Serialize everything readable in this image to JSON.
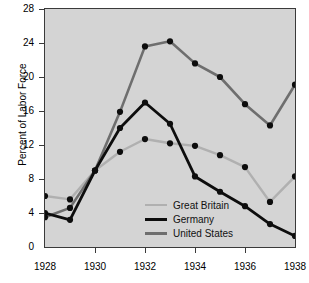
{
  "chart_data": {
    "type": "line",
    "title": "",
    "xlabel": "",
    "ylabel": "Percent of Labor Force",
    "x": [
      1928,
      1929,
      1930,
      1931,
      1932,
      1933,
      1934,
      1935,
      1936,
      1937,
      1938
    ],
    "xlim": [
      1928,
      1938
    ],
    "ylim": [
      0,
      28
    ],
    "yticks": [
      0,
      4,
      8,
      12,
      16,
      20,
      24,
      28
    ],
    "xticks": [
      1928,
      1930,
      1932,
      1934,
      1936,
      1938
    ],
    "xtick_labels": [
      "1928",
      "1930",
      "1932",
      "1934",
      "1936",
      "1938"
    ],
    "ytick_labels": [
      "0",
      "4",
      "8",
      "12",
      "16",
      "20",
      "24",
      "28"
    ],
    "grid": false,
    "legend_position": "center-left",
    "series": [
      {
        "name": "Great Britain",
        "color": "#b0b0b0",
        "width": 2.4,
        "values": [
          6.0,
          5.6,
          9.0,
          11.2,
          12.7,
          12.2,
          11.9,
          10.8,
          9.4,
          5.3,
          8.3
        ]
      },
      {
        "name": "Germany",
        "color": "#0d0d0d",
        "width": 2.8,
        "values": [
          4.0,
          3.2,
          9.0,
          14.0,
          17.0,
          14.5,
          8.3,
          6.5,
          4.8,
          2.7,
          1.3
        ]
      },
      {
        "name": "United States",
        "color": "#6e6e6e",
        "width": 2.6,
        "values": [
          3.5,
          4.6,
          9.0,
          15.9,
          23.6,
          24.2,
          21.6,
          20.0,
          16.8,
          14.3,
          19.1
        ]
      }
    ]
  },
  "legend": {
    "items": [
      {
        "label": "Great Britain"
      },
      {
        "label": "Germany"
      },
      {
        "label": "United States"
      }
    ]
  }
}
